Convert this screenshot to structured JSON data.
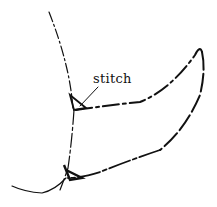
{
  "diagram": {
    "labels": [
      {
        "text": "stitch",
        "target": "junction where lines meet"
      }
    ],
    "stroke_color": "#111111",
    "background": "#ffffff"
  }
}
